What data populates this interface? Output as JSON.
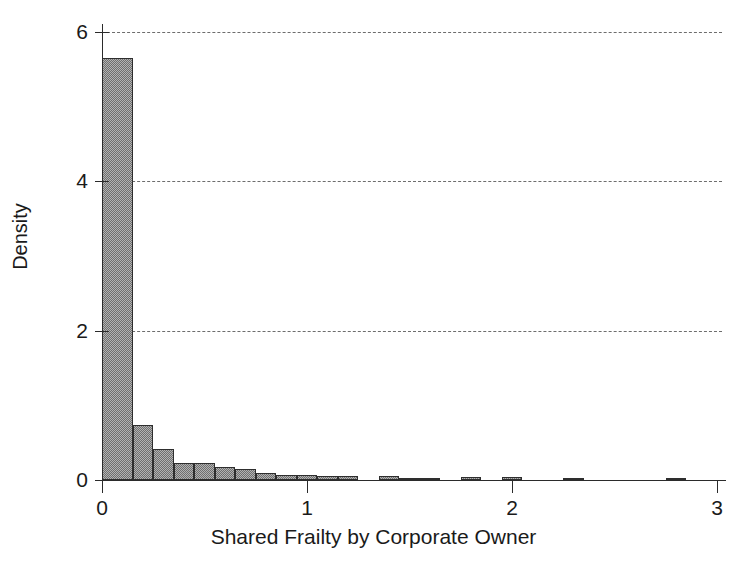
{
  "chart_data": {
    "type": "bar",
    "title": "",
    "xlabel": "Shared Frailty by Corporate Owner",
    "ylabel": "Density",
    "xlim": [
      -0.04,
      3.05
    ],
    "ylim": [
      0,
      6.1
    ],
    "xticks": [
      0,
      1,
      2,
      3
    ],
    "xtick_labels": [
      "0",
      "1",
      "2",
      "3"
    ],
    "yticks": [
      0,
      2,
      4,
      6
    ],
    "ytick_labels": [
      "0",
      "2",
      "4",
      "6"
    ],
    "grid": "horizontal-dashed",
    "legend": "none",
    "bin_width": 0.1,
    "bin_edges": [
      0.0,
      0.15,
      0.25,
      0.35,
      0.45,
      0.55,
      0.65,
      0.75,
      0.85,
      0.95,
      1.05,
      1.15,
      1.25,
      1.35,
      1.45,
      1.55,
      1.65,
      1.75,
      1.85,
      1.95,
      2.05,
      2.15,
      2.25,
      2.35,
      2.45,
      2.55,
      2.65,
      2.75,
      2.85,
      2.95
    ],
    "values": [
      5.65,
      0.74,
      0.41,
      0.23,
      0.23,
      0.18,
      0.15,
      0.09,
      0.07,
      0.07,
      0.05,
      0.0,
      0.06,
      0.03,
      0.0,
      0.0,
      0.0,
      0.0,
      0.0,
      0.04,
      0.0,
      0.03,
      0.0,
      0.0,
      0.02,
      0.0,
      0.0,
      0.02,
      0.0
    ],
    "bars": [
      {
        "x0": 0.0,
        "x1": 0.15,
        "value": 5.65
      },
      {
        "x0": 0.15,
        "x1": 0.25,
        "value": 0.74
      },
      {
        "x0": 0.25,
        "x1": 0.35,
        "value": 0.41
      },
      {
        "x0": 0.35,
        "x1": 0.45,
        "value": 0.23
      },
      {
        "x0": 0.45,
        "x1": 0.55,
        "value": 0.23
      },
      {
        "x0": 0.55,
        "x1": 0.65,
        "value": 0.18
      },
      {
        "x0": 0.65,
        "x1": 0.75,
        "value": 0.15
      },
      {
        "x0": 0.75,
        "x1": 0.85,
        "value": 0.09
      },
      {
        "x0": 0.85,
        "x1": 0.95,
        "value": 0.07
      },
      {
        "x0": 0.95,
        "x1": 1.05,
        "value": 0.07
      },
      {
        "x0": 1.05,
        "x1": 1.15,
        "value": 0.05
      },
      {
        "x0": 1.15,
        "x1": 1.25,
        "value": 0.05
      },
      {
        "x0": 1.35,
        "x1": 1.45,
        "value": 0.055
      },
      {
        "x0": 1.45,
        "x1": 1.65,
        "value": 0.02
      },
      {
        "x0": 1.75,
        "x1": 1.85,
        "value": 0.035
      },
      {
        "x0": 1.95,
        "x1": 2.05,
        "value": 0.035
      },
      {
        "x0": 2.25,
        "x1": 2.35,
        "value": 0.03
      },
      {
        "x0": 2.75,
        "x1": 2.85,
        "value": 0.025
      }
    ]
  },
  "axes": {
    "y_title": "Density",
    "x_title": "Shared Frailty by Corporate Owner"
  }
}
